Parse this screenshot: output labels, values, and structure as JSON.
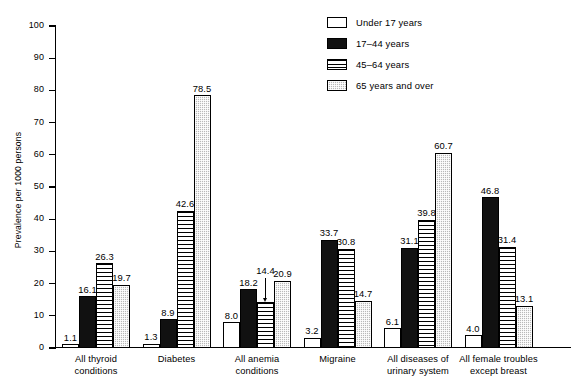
{
  "chart_data": {
    "type": "bar",
    "title": "",
    "xlabel": "",
    "ylabel": "Prevalence per 1000 persons",
    "ylim": [
      0,
      100
    ],
    "yticks": [
      0,
      10,
      20,
      30,
      40,
      50,
      60,
      70,
      80,
      90,
      100
    ],
    "grid": false,
    "legend_position": "top-right",
    "categories": [
      "All thyroid conditions",
      "Diabetes",
      "All anemia conditions",
      "Migraine",
      "All diseases of urinary system",
      "All female troubles except breast"
    ],
    "category_lines": [
      [
        "All thyroid",
        "conditions"
      ],
      [
        "Diabetes",
        ""
      ],
      [
        "All anemia",
        "conditions"
      ],
      [
        "Migraine",
        ""
      ],
      [
        "All diseases of",
        "urinary system"
      ],
      [
        "All female troubles",
        "except breast"
      ]
    ],
    "series": [
      {
        "name": "Under 17 years",
        "fill": "white",
        "values": [
          1.1,
          1.3,
          8.0,
          3.2,
          6.1,
          4.0
        ],
        "labels": [
          "1.1",
          "1.3",
          "8.0",
          "3.2",
          "6.1",
          "4.0"
        ]
      },
      {
        "name": "17–44 years",
        "fill": "black",
        "values": [
          16.1,
          8.9,
          18.2,
          33.7,
          31.1,
          46.8
        ],
        "labels": [
          "16.1",
          "8.9",
          "18.2",
          "33.7",
          "31.1",
          "46.8"
        ]
      },
      {
        "name": "45–64 years",
        "fill": "horizontal-stripes",
        "values": [
          26.3,
          42.6,
          14.4,
          30.8,
          39.8,
          31.4
        ],
        "labels": [
          "26.3",
          "42.6",
          "14.4",
          "30.8",
          "39.8",
          "31.4"
        ]
      },
      {
        "name": "65 years and over",
        "fill": "gray-checker",
        "values": [
          19.7,
          78.5,
          20.9,
          14.7,
          60.7,
          13.1
        ],
        "labels": [
          "19.7",
          "78.5",
          "20.9",
          "14.7",
          "60.7",
          "13.1"
        ]
      }
    ],
    "annotations": [
      {
        "text": "14.4",
        "category": "All anemia conditions",
        "series": "45–64 years",
        "style": "leader-arrow-down"
      }
    ]
  },
  "legend": {
    "items": [
      {
        "label": "Under 17 years",
        "fill": "white"
      },
      {
        "label": "17–44 years",
        "fill": "black"
      },
      {
        "label": "45–64 years",
        "fill": "horizontal-stripes"
      },
      {
        "label": "65 years and over",
        "fill": "gray-checker"
      }
    ]
  },
  "axis": {
    "y_title": "Prevalence per 1000 persons",
    "y_tick_labels": [
      "0",
      "10",
      "20",
      "30",
      "40",
      "50",
      "60",
      "70",
      "80",
      "90",
      "100"
    ]
  }
}
